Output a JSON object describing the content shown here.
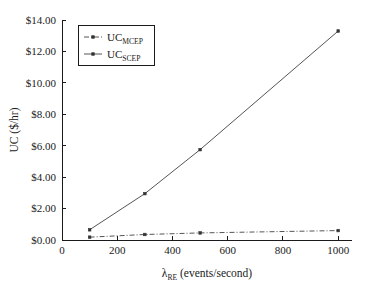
{
  "chart_data": {
    "type": "line",
    "title": "",
    "xlabel": "λRE (events/second)",
    "xlabel_main": "λ",
    "xlabel_sub": "RE",
    "xlabel_rest": " (events/second)",
    "ylabel": "UC ($/hr)",
    "xlim": [
      0,
      1050
    ],
    "ylim": [
      0,
      14
    ],
    "grid": false,
    "legend_position": "upper left",
    "x_ticks": [
      0,
      200,
      400,
      600,
      800,
      1000
    ],
    "x_tick_labels": [
      "0",
      "200",
      "400",
      "600",
      "800",
      "1000"
    ],
    "y_ticks": [
      0,
      2,
      4,
      6,
      8,
      10,
      12,
      14
    ],
    "y_tick_labels": [
      "$0.00",
      "$2.00",
      "$4.00",
      "$6.00",
      "$8.00",
      "$10.00",
      "$12.00",
      "$14.00"
    ],
    "x": [
      100,
      300,
      500,
      1000
    ],
    "series": [
      {
        "name": "UC_MCEP",
        "label_main": "UC",
        "label_sub": "MCEP",
        "style": "dash-dot",
        "marker": "square",
        "color": "#555555",
        "values": [
          0.18,
          0.35,
          0.45,
          0.6
        ]
      },
      {
        "name": "UC_SCEP",
        "label_main": "UC",
        "label_sub": "SCEP",
        "style": "solid",
        "marker": "square",
        "color": "#555555",
        "values": [
          0.65,
          2.95,
          5.75,
          13.3
        ]
      }
    ]
  },
  "colors": {
    "background": "#ffffff",
    "axis": "#1a1a1a",
    "line": "#555555",
    "marker": "#333333"
  }
}
